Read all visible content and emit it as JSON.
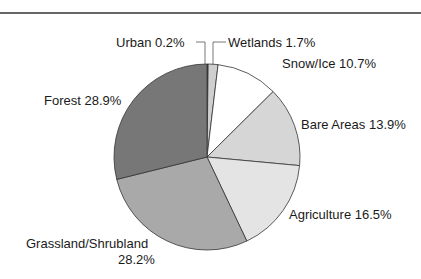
{
  "chart_data": {
    "type": "pie",
    "title": "",
    "start_angle_deg": 0,
    "direction": "clockwise",
    "slices": [
      {
        "label": "Urban",
        "value": 0.2,
        "display": "Urban 0.2%",
        "color": "#444444"
      },
      {
        "label": "Wetlands",
        "value": 1.7,
        "display": "Wetlands 1.7%",
        "color": "#cfcfcf"
      },
      {
        "label": "Snow/Ice",
        "value": 10.7,
        "display": "Snow/Ice 10.7%",
        "color": "#ffffff"
      },
      {
        "label": "Bare Areas",
        "value": 13.9,
        "display": "Bare Areas 13.9%",
        "color": "#d6d6d6"
      },
      {
        "label": "Agriculture",
        "value": 16.5,
        "display": "Agriculture 16.5%",
        "color": "#e4e4e4"
      },
      {
        "label": "Grassland/Shrubland",
        "value": 28.2,
        "display_line1": "Grassland/Shrubland",
        "display_line2": "28.2%",
        "color": "#a9a9a9"
      },
      {
        "label": "Forest",
        "value": 28.9,
        "display": "Forest 28.9%",
        "color": "#777777"
      }
    ],
    "center": [
      207,
      157
    ],
    "radius": 93
  }
}
